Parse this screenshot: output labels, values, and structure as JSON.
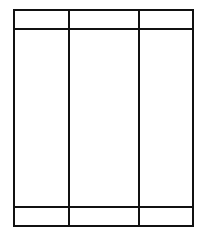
{
  "diagram": {
    "type": "table-wireframe",
    "columns": 3,
    "rows": [
      {
        "role": "header",
        "cells": [
          "",
          "",
          ""
        ]
      },
      {
        "role": "body",
        "cells": [
          "",
          "",
          ""
        ]
      },
      {
        "role": "footer",
        "cells": [
          "",
          "",
          ""
        ]
      }
    ],
    "colors": {
      "line": "#111111",
      "background": "#ffffff"
    }
  }
}
